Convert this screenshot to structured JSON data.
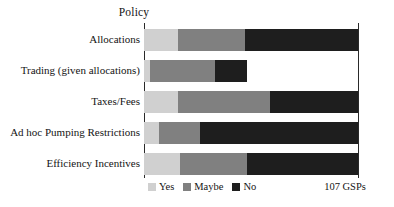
{
  "chart_data": {
    "type": "bar",
    "orientation": "horizontal",
    "stacked": true,
    "stack_mode": "absolute_counts_of_total",
    "title": "Policy",
    "xlabel": "",
    "ylabel": "",
    "xlim": [
      0,
      100
    ],
    "grid": false,
    "legend_position": "bottom-left",
    "annotation": "107 GSPs",
    "categories": [
      "Allocations",
      "Trading (given allocations)",
      "Taxes/Fees",
      "Ad hoc Pumping Restrictions",
      "Efficiency Incentives"
    ],
    "series": [
      {
        "name": "Yes",
        "color": "#d0d0d0",
        "values": [
          16,
          3,
          16,
          7,
          17
        ]
      },
      {
        "name": "Maybe",
        "color": "#808080",
        "values": [
          31,
          30,
          43,
          19,
          31
        ]
      },
      {
        "name": "No",
        "color": "#1e1e1e",
        "values": [
          53,
          15,
          41,
          74,
          52
        ]
      }
    ],
    "rows": [
      {
        "category": "Allocations",
        "segments": [
          {
            "label": "Yes",
            "value": 16,
            "color": "#d0d0d0"
          },
          {
            "label": "Maybe",
            "value": 31,
            "color": "#808080"
          },
          {
            "label": "No",
            "value": 53,
            "color": "#1e1e1e"
          }
        ]
      },
      {
        "category": "Trading (given allocations)",
        "segments": [
          {
            "label": "Yes",
            "value": 3,
            "color": "#d0d0d0"
          },
          {
            "label": "Maybe",
            "value": 30,
            "color": "#808080"
          },
          {
            "label": "No",
            "value": 15,
            "color": "#1e1e1e"
          }
        ]
      },
      {
        "category": "Taxes/Fees",
        "segments": [
          {
            "label": "Yes",
            "value": 16,
            "color": "#d0d0d0"
          },
          {
            "label": "Maybe",
            "value": 43,
            "color": "#808080"
          },
          {
            "label": "No",
            "value": 41,
            "color": "#1e1e1e"
          }
        ]
      },
      {
        "category": "Ad hoc Pumping Restrictions",
        "segments": [
          {
            "label": "Yes",
            "value": 7,
            "color": "#d0d0d0"
          },
          {
            "label": "Maybe",
            "value": 19,
            "color": "#808080"
          },
          {
            "label": "No",
            "value": 74,
            "color": "#1e1e1e"
          }
        ]
      },
      {
        "category": "Efficiency Incentives",
        "segments": [
          {
            "label": "Yes",
            "value": 17,
            "color": "#d0d0d0"
          },
          {
            "label": "Maybe",
            "value": 31,
            "color": "#808080"
          },
          {
            "label": "No",
            "value": 52,
            "color": "#1e1e1e"
          }
        ]
      }
    ]
  },
  "legend": {
    "items": [
      {
        "label": "Yes",
        "color": "#d0d0d0"
      },
      {
        "label": "Maybe",
        "color": "#808080"
      },
      {
        "label": "No",
        "color": "#1e1e1e"
      }
    ]
  },
  "footnote": {
    "total_label": "107 GSPs"
  }
}
